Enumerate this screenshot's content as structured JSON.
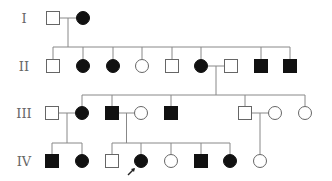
{
  "diagram": {
    "type": "pedigree",
    "generations": [
      "I",
      "II",
      "III",
      "IV"
    ],
    "legend_colors": {
      "affected": "#111111",
      "unaffected": "#ffffff",
      "outline": "#666666"
    },
    "individuals": [
      {
        "id": "I-1",
        "gen": 0,
        "sex": "male",
        "affected": false
      },
      {
        "id": "I-2",
        "gen": 0,
        "sex": "female",
        "affected": true
      },
      {
        "id": "II-1",
        "gen": 1,
        "sex": "male",
        "affected": false
      },
      {
        "id": "II-2",
        "gen": 1,
        "sex": "female",
        "affected": true
      },
      {
        "id": "II-3",
        "gen": 1,
        "sex": "female",
        "affected": true
      },
      {
        "id": "II-4",
        "gen": 1,
        "sex": "female",
        "affected": false
      },
      {
        "id": "II-5",
        "gen": 1,
        "sex": "male",
        "affected": false
      },
      {
        "id": "II-6",
        "gen": 1,
        "sex": "female",
        "affected": true
      },
      {
        "id": "II-7",
        "gen": 1,
        "sex": "male",
        "affected": false
      },
      {
        "id": "II-8",
        "gen": 1,
        "sex": "male",
        "affected": true
      },
      {
        "id": "II-9",
        "gen": 1,
        "sex": "male",
        "affected": true
      },
      {
        "id": "III-1",
        "gen": 2,
        "sex": "male",
        "affected": false
      },
      {
        "id": "III-2",
        "gen": 2,
        "sex": "female",
        "affected": true
      },
      {
        "id": "III-3",
        "gen": 2,
        "sex": "male",
        "affected": true
      },
      {
        "id": "III-4",
        "gen": 2,
        "sex": "female",
        "affected": false
      },
      {
        "id": "III-5",
        "gen": 2,
        "sex": "male",
        "affected": true
      },
      {
        "id": "III-6",
        "gen": 2,
        "sex": "male",
        "affected": false
      },
      {
        "id": "III-7",
        "gen": 2,
        "sex": "female",
        "affected": false
      },
      {
        "id": "III-8",
        "gen": 2,
        "sex": "female",
        "affected": false
      },
      {
        "id": "IV-1",
        "gen": 3,
        "sex": "male",
        "affected": true
      },
      {
        "id": "IV-2",
        "gen": 3,
        "sex": "female",
        "affected": true
      },
      {
        "id": "IV-3",
        "gen": 3,
        "sex": "male",
        "affected": false
      },
      {
        "id": "IV-4",
        "gen": 3,
        "sex": "female",
        "affected": true,
        "proband": true
      },
      {
        "id": "IV-5",
        "gen": 3,
        "sex": "female",
        "affected": false
      },
      {
        "id": "IV-6",
        "gen": 3,
        "sex": "male",
        "affected": true
      },
      {
        "id": "IV-7",
        "gen": 3,
        "sex": "female",
        "affected": true
      },
      {
        "id": "IV-8",
        "gen": 3,
        "sex": "female",
        "affected": false
      }
    ],
    "matings": [
      {
        "partners": [
          "I-1",
          "I-2"
        ],
        "children": [
          "II-1",
          "II-2",
          "II-3",
          "II-4",
          "II-5",
          "II-6",
          "II-8",
          "II-9"
        ]
      },
      {
        "partners": [
          "II-6",
          "II-7"
        ],
        "children": [
          "III-2",
          "III-3",
          "III-5",
          "III-6",
          "III-8"
        ]
      },
      {
        "partners": [
          "III-1",
          "III-2"
        ],
        "children": [
          "IV-1",
          "IV-2"
        ]
      },
      {
        "partners": [
          "III-3",
          "III-4"
        ],
        "children": [
          "IV-3",
          "IV-4",
          "IV-5",
          "IV-6",
          "IV-7"
        ]
      },
      {
        "partners": [
          "III-6",
          "III-7"
        ],
        "children": [
          "IV-8"
        ]
      }
    ]
  }
}
